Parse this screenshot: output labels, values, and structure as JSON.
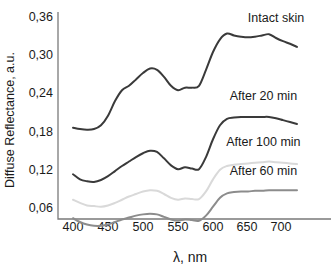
{
  "chart_data": {
    "type": "line",
    "title": "",
    "xlabel": "λ, nm",
    "ylabel": "Diffuse Reflectance, a.u.",
    "xlim": [
      395,
      725
    ],
    "ylim": [
      0.014,
      0.363
    ],
    "grid": false,
    "legend_position": "inline-right-of-curves",
    "xticks": [
      "400",
      "450",
      "500",
      "550",
      "600",
      "650",
      "700"
    ],
    "xtick_values": [
      400,
      450,
      500,
      550,
      600,
      650,
      700
    ],
    "yticks": [
      "0,36",
      "0,30",
      "0,24",
      "0,18",
      "0,12",
      "0,06"
    ],
    "ytick_values": [
      0.36,
      0.3,
      0.24,
      0.18,
      0.12,
      0.06
    ],
    "decimal_separator": ",",
    "x": [
      400,
      410,
      420,
      430,
      440,
      450,
      460,
      470,
      480,
      490,
      500,
      510,
      520,
      530,
      540,
      550,
      560,
      570,
      580,
      590,
      600,
      610,
      620,
      630,
      640,
      650,
      660,
      670,
      680,
      690,
      700,
      710,
      720
    ],
    "series": [
      {
        "name": "Intact skin",
        "label": "Intact skin",
        "color": "#3a3a3a",
        "values": [
          0.186,
          0.184,
          0.183,
          0.184,
          0.19,
          0.205,
          0.228,
          0.245,
          0.252,
          0.262,
          0.272,
          0.279,
          0.277,
          0.266,
          0.252,
          0.245,
          0.249,
          0.249,
          0.252,
          0.277,
          0.305,
          0.325,
          0.334,
          0.331,
          0.329,
          0.328,
          0.329,
          0.331,
          0.333,
          0.327,
          0.322,
          0.318,
          0.313
        ]
      },
      {
        "name": "After 20 min",
        "label": "After 20 min",
        "color": "#3a3a3a",
        "values": [
          0.113,
          0.105,
          0.102,
          0.101,
          0.104,
          0.11,
          0.118,
          0.126,
          0.133,
          0.14,
          0.146,
          0.15,
          0.148,
          0.138,
          0.127,
          0.121,
          0.124,
          0.122,
          0.121,
          0.14,
          0.168,
          0.19,
          0.2,
          0.202,
          0.203,
          0.203,
          0.203,
          0.203,
          0.203,
          0.201,
          0.198,
          0.195,
          0.192
        ]
      },
      {
        "name": "After 100 min",
        "label": "After 100 min",
        "color": "#d9d9d9",
        "values": [
          0.073,
          0.068,
          0.064,
          0.063,
          0.062,
          0.064,
          0.068,
          0.073,
          0.078,
          0.082,
          0.086,
          0.088,
          0.087,
          0.082,
          0.076,
          0.073,
          0.075,
          0.074,
          0.074,
          0.086,
          0.105,
          0.12,
          0.126,
          0.128,
          0.129,
          0.13,
          0.131,
          0.132,
          0.133,
          0.132,
          0.131,
          0.13,
          0.129
        ]
      },
      {
        "name": "After 60 min",
        "label": "After 60 min",
        "color": "#8c8c8c",
        "values": [
          0.044,
          0.038,
          0.034,
          0.032,
          0.032,
          0.034,
          0.038,
          0.042,
          0.045,
          0.048,
          0.05,
          0.051,
          0.05,
          0.046,
          0.042,
          0.04,
          0.042,
          0.041,
          0.04,
          0.048,
          0.062,
          0.076,
          0.083,
          0.085,
          0.086,
          0.086,
          0.087,
          0.087,
          0.088,
          0.088,
          0.088,
          0.088,
          0.088
        ]
      }
    ],
    "series_labels": [
      {
        "text": "Intact skin",
        "x": 690,
        "y": 0.352
      },
      {
        "text": "After 20 min",
        "x": 672,
        "y": 0.229
      },
      {
        "text": "After 100 min",
        "x": 672,
        "y": 0.158
      },
      {
        "text": "After 60 min",
        "x": 672,
        "y": 0.112
      }
    ]
  }
}
